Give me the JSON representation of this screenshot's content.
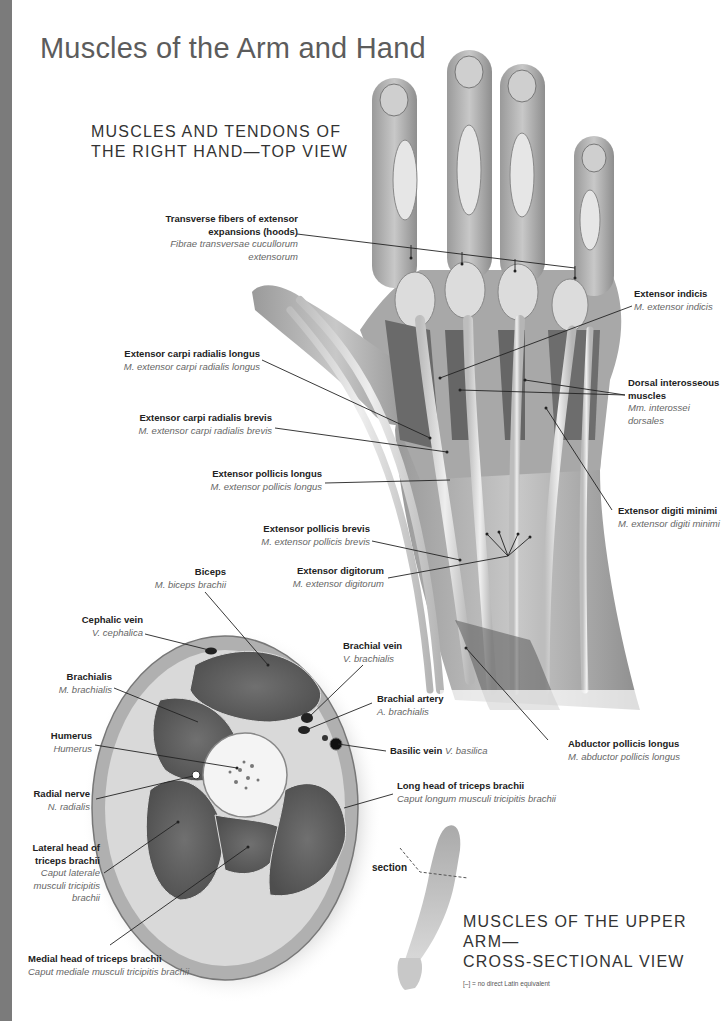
{
  "page": {
    "title": "Muscles of the Arm and Hand",
    "accent_bar_color": "#7b7b7b"
  },
  "hand_view": {
    "heading_line1": "MUSCLES AND TENDONS OF",
    "heading_line2": "THE RIGHT HAND—TOP VIEW",
    "labels": [
      {
        "id": "transverse-fibers",
        "en": "Transverse fibers of extensor expansions (hoods)",
        "la": "Fibrae transversae cucullorum extensorum"
      },
      {
        "id": "extensor-indicis",
        "en": "Extensor indicis",
        "la": "M. extensor indicis"
      },
      {
        "id": "ecrl",
        "en": "Extensor carpi radialis longus",
        "la": "M. extensor carpi radialis longus"
      },
      {
        "id": "dorsal-interosseous",
        "en": "Dorsal interosseous muscles",
        "la": "Mm. interossei dorsales"
      },
      {
        "id": "ecrb",
        "en": "Extensor carpi radialis brevis",
        "la": "M. extensor carpi radialis brevis"
      },
      {
        "id": "epl",
        "en": "Extensor pollicis longus",
        "la": "M. extensor pollicis longus"
      },
      {
        "id": "extensor-digiti-minimi",
        "en": "Extensor digiti minimi",
        "la": "M. extensor digiti minimi"
      },
      {
        "id": "epb",
        "en": "Extensor pollicis brevis",
        "la": "M. extensor pollicis brevis"
      },
      {
        "id": "extensor-digitorum",
        "en": "Extensor digitorum",
        "la": "M. extensor digitorum"
      },
      {
        "id": "apl",
        "en": "Abductor pollicis longus",
        "la": "M. abductor pollicis longus"
      }
    ]
  },
  "cross_section": {
    "heading_line1": "MUSCLES OF THE UPPER ARM—",
    "heading_line2": "CROSS-SECTIONAL VIEW",
    "section_label": "section",
    "labels": [
      {
        "id": "biceps",
        "en": "Biceps",
        "la": "M. biceps brachii"
      },
      {
        "id": "cephalic-vein",
        "en": "Cephalic vein",
        "la": "V. cephalica"
      },
      {
        "id": "brachial-vein",
        "en": "Brachial vein",
        "la": "V. brachialis"
      },
      {
        "id": "brachialis",
        "en": "Brachialis",
        "la": "M. brachialis"
      },
      {
        "id": "brachial-artery",
        "en": "Brachial artery",
        "la": "A. brachialis"
      },
      {
        "id": "humerus",
        "en": "Humerus",
        "la": "Humerus"
      },
      {
        "id": "basilic-vein",
        "en": "Basilic vein",
        "la": "V. basilica"
      },
      {
        "id": "radial-nerve",
        "en": "Radial nerve",
        "la": "N. radialis"
      },
      {
        "id": "long-head-triceps",
        "en": "Long head of triceps brachii",
        "la": "Caput longum musculi tricipitis brachii"
      },
      {
        "id": "lateral-head-triceps",
        "en": "Lateral head of triceps brachii",
        "la": "Caput laterale musculi tricipitis brachii"
      },
      {
        "id": "medial-head-triceps",
        "en": "Medial head of triceps brachii",
        "la": "Caput mediale musculi tricipitis brachii"
      }
    ]
  },
  "footnote": "[–] = no direct Latin equivalent"
}
